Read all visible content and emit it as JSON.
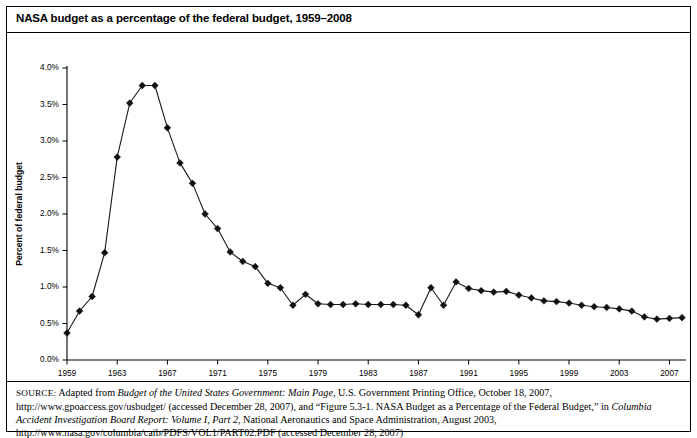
{
  "figure": {
    "title": "NASA budget as a percentage of the federal budget, 1959–2008",
    "source_label": "SOURCE:",
    "source_text_parts": {
      "p1": " Adapted from ",
      "i1": "Budget of the United States Government: Main Page",
      "p2": ", U.S. Government Printing Office, October 18, 2007, http://www.gpoaccess.gov/usbudget/ (accessed December 28, 2007), and “Figure 5.3-1. NASA Budget as a Percentage of the Federal Budget,” in ",
      "i2": "Columbia Accident Investigation Board Report: Volume I, Part 2",
      "p3": ", National Aeronautics and Space Administration, August 2003, http://www.nasa.gov/columbia/caib/PDFS/VOL1/PART02.PDF (accessed December 28, 2007)"
    }
  },
  "chart_data": {
    "type": "line",
    "title": "NASA budget as a percentage of the federal budget, 1959–2008",
    "xlabel": "",
    "ylabel": "Percent of federal budget",
    "xlim": [
      1959,
      2008
    ],
    "ylim": [
      0.0,
      4.0
    ],
    "grid": false,
    "legend": false,
    "marker": "diamond",
    "ytick_labels": [
      "0.0%",
      "0.5%",
      "1.0%",
      "1.5%",
      "2.0%",
      "2.5%",
      "3.0%",
      "3.5%",
      "4.0%"
    ],
    "ytick_values": [
      0.0,
      0.5,
      1.0,
      1.5,
      2.0,
      2.5,
      3.0,
      3.5,
      4.0
    ],
    "xtick_labels": [
      "1959",
      "1963",
      "1967",
      "1971",
      "1975",
      "1979",
      "1983",
      "1987",
      "1991",
      "1995",
      "1999",
      "2003",
      "2007"
    ],
    "xtick_values": [
      1959,
      1963,
      1967,
      1971,
      1975,
      1979,
      1983,
      1987,
      1991,
      1995,
      1999,
      2003,
      2007
    ],
    "x": [
      1959,
      1960,
      1961,
      1962,
      1963,
      1964,
      1965,
      1966,
      1967,
      1968,
      1969,
      1970,
      1971,
      1972,
      1973,
      1974,
      1975,
      1976,
      1977,
      1978,
      1979,
      1980,
      1981,
      1982,
      1983,
      1984,
      1985,
      1986,
      1987,
      1988,
      1989,
      1990,
      1991,
      1992,
      1993,
      1994,
      1995,
      1996,
      1997,
      1998,
      1999,
      2000,
      2001,
      2002,
      2003,
      2004,
      2005,
      2006,
      2007,
      2008
    ],
    "values": [
      0.37,
      0.67,
      0.87,
      1.47,
      2.78,
      3.52,
      3.76,
      3.76,
      3.18,
      2.7,
      2.42,
      2.0,
      1.8,
      1.48,
      1.35,
      1.28,
      1.05,
      0.99,
      0.75,
      0.9,
      0.77,
      0.76,
      0.76,
      0.77,
      0.76,
      0.76,
      0.76,
      0.75,
      0.62,
      0.99,
      0.75,
      1.07,
      0.98,
      0.95,
      0.93,
      0.94,
      0.89,
      0.85,
      0.81,
      0.8,
      0.78,
      0.75,
      0.73,
      0.72,
      0.7,
      0.67,
      0.59,
      0.56,
      0.57,
      0.58
    ],
    "series": [
      {
        "name": "NASA budget as percent of federal budget",
        "values": [
          0.37,
          0.67,
          0.87,
          1.47,
          2.78,
          3.52,
          3.76,
          3.76,
          3.18,
          2.7,
          2.42,
          2.0,
          1.8,
          1.48,
          1.35,
          1.28,
          1.05,
          0.99,
          0.75,
          0.9,
          0.77,
          0.76,
          0.76,
          0.77,
          0.76,
          0.76,
          0.76,
          0.75,
          0.62,
          0.99,
          0.75,
          1.07,
          0.98,
          0.95,
          0.93,
          0.94,
          0.89,
          0.85,
          0.81,
          0.8,
          0.78,
          0.75,
          0.73,
          0.72,
          0.7,
          0.67,
          0.59,
          0.56,
          0.57,
          0.58
        ]
      }
    ]
  }
}
